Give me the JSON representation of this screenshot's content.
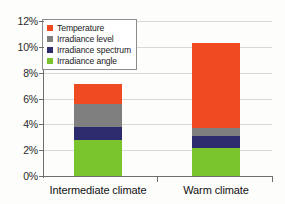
{
  "chart_data": {
    "type": "bar",
    "subtype": "stacked",
    "title": "",
    "subtitle": "",
    "xlabel": "",
    "ylabel": "",
    "categories": [
      "Intermediate climate",
      "Warm climate"
    ],
    "series": [
      {
        "name": "Irradiance angle",
        "color": "#7ac42e",
        "values": [
          2.75,
          2.2
        ]
      },
      {
        "name": "Irradiance spectrum",
        "color": "#2b2b6e",
        "values": [
          1.05,
          0.9
        ]
      },
      {
        "name": "Irradiance level",
        "color": "#7f7f7f",
        "values": [
          1.8,
          0.6
        ]
      },
      {
        "name": "Temperature",
        "color": "#f04a23",
        "values": [
          1.5,
          6.6
        ]
      }
    ],
    "totals": [
      7.1,
      10.3
    ],
    "ylim": [
      0,
      12
    ],
    "ytick_values": [
      0,
      2,
      4,
      6,
      8,
      10,
      12
    ],
    "ytick_labels": [
      "0%",
      "2%",
      "4%",
      "6%",
      "8%",
      "10%",
      "12%"
    ],
    "grid": true,
    "grid_axis": "y",
    "legend_position": "top-left",
    "legend_order": [
      "Temperature",
      "Irradiance level",
      "Irradiance spectrum",
      "Irradiance angle"
    ],
    "value_format": "percent"
  },
  "legend": {
    "items": [
      {
        "label": "Temperature",
        "color": "#f04a23",
        "swatch_name": "legend-swatch-temperature"
      },
      {
        "label": "Irradiance level",
        "color": "#7f7f7f",
        "swatch_name": "legend-swatch-irradiance-level"
      },
      {
        "label": "Irradiance spectrum",
        "color": "#2b2b6e",
        "swatch_name": "legend-swatch-irradiance-spectrum"
      },
      {
        "label": "Irradiance angle",
        "color": "#7ac42e",
        "swatch_name": "legend-swatch-irradiance-angle"
      }
    ]
  },
  "axes": {
    "y": {
      "labels": [
        "12%",
        "10%",
        "8%",
        "6%",
        "4%",
        "2%",
        "0%"
      ]
    },
    "x": {
      "labels": [
        "Intermediate climate",
        "Warm climate"
      ]
    }
  },
  "colors": {
    "temperature": "#f04a23",
    "irradiance_level": "#7f7f7f",
    "irradiance_spectrum": "#2b2b6e",
    "irradiance_angle": "#7ac42e",
    "axis": "#6e6e6e",
    "gridline": "#d8d8d4",
    "background": "#fdfdfb"
  }
}
